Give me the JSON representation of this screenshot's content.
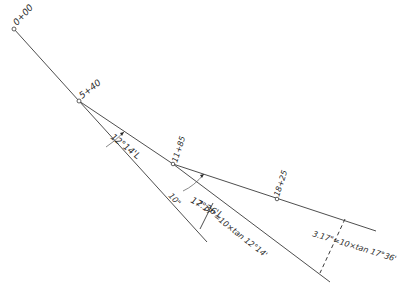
{
  "diagram": {
    "type": "route-alignment-offset-sketch",
    "stations": [
      {
        "id": "sta-0",
        "label": "0+00",
        "x": 14,
        "y": 29
      },
      {
        "id": "sta-1",
        "label": "5+40",
        "x": 79,
        "y": 101
      },
      {
        "id": "sta-2",
        "label": "11+85",
        "x": 173,
        "y": 164
      },
      {
        "id": "sta-3",
        "label": "18+25",
        "x": 277,
        "y": 199
      }
    ],
    "angles": [
      {
        "id": "angle-1",
        "label": "12°14'L"
      },
      {
        "id": "angle-2",
        "label": "17°36'L"
      }
    ],
    "distances": [
      {
        "id": "dist-1",
        "label": "10\""
      }
    ],
    "offsets": [
      {
        "id": "offset-1",
        "label": "2.17\"=10×tan 12°14'"
      },
      {
        "id": "offset-2",
        "label": "3.17\"=10×tan 17°36'"
      }
    ],
    "colors": {
      "line": "#3a3a3a",
      "background": "#ffffff"
    }
  }
}
